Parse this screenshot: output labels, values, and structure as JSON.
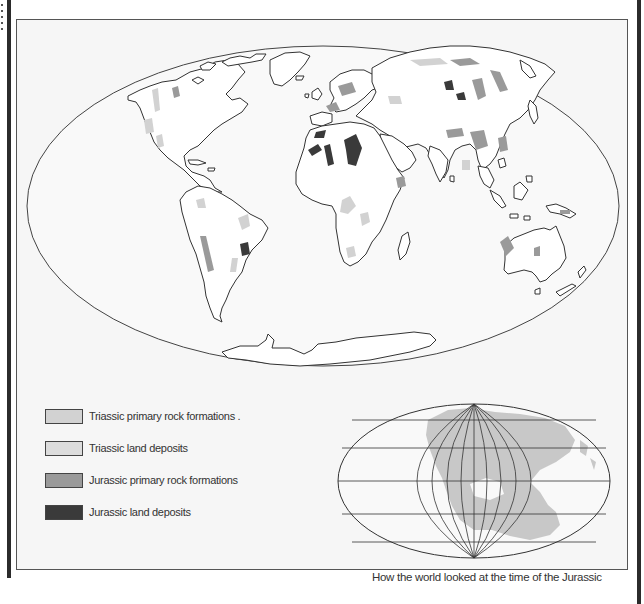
{
  "map": {
    "title": "Triassic and Jurassic rock formations — world map",
    "projection": "Mollweide-style elliptical world projection",
    "colors": {
      "background": "#f6f6f6",
      "land": "#ffffff",
      "coastline": "#333333",
      "triassic_primary": "#d2d2d2",
      "triassic_land": "#dcdcdc",
      "jurassic_primary": "#9a9a9a",
      "jurassic_land": "#3a3a3a",
      "paleo_land": "#c8c8c8"
    }
  },
  "legend": {
    "items": [
      {
        "label": "Triassic primary rock formations .",
        "color": "#d2d2d2"
      },
      {
        "label": "Triassic land deposits",
        "color": "#dcdcdc"
      },
      {
        "label": "Jurassic primary rock formations",
        "color": "#9a9a9a"
      },
      {
        "label": "Jurassic land deposits",
        "color": "#3a3a3a"
      }
    ]
  },
  "inset": {
    "caption": "How the world looked at the time of the Jurassic"
  }
}
